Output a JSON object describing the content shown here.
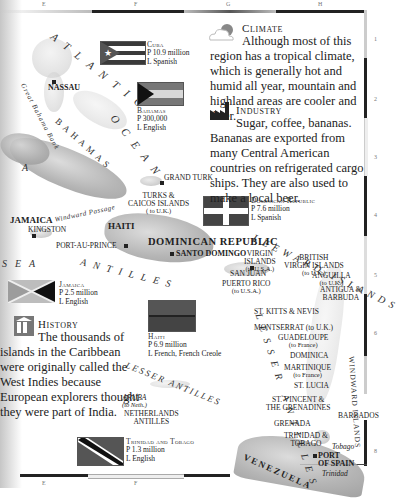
{
  "grid": {
    "columns": [
      "E",
      "F",
      "G",
      "H"
    ],
    "rows": [
      "1",
      "2",
      "3",
      "4",
      "5",
      "6",
      "7",
      "8"
    ]
  },
  "seas": {
    "atlantic": "ATLANTIC",
    "ocean": "OCEAN",
    "sea": "SEA",
    "antilles": "ANTILLES",
    "greater_letters": "A",
    "leeward": "LEEWARD ISLANDS",
    "windward": "WINDWARD ISLANDS",
    "lesser_antilles_east": "LESSER ANTILLES",
    "lesser_antilles_south": "LESSER ANTILLES",
    "bahamas_region": "BAHAMAS",
    "great_bahama_bank": "Great Bahama Bank",
    "windward_passage": "Windward Passage"
  },
  "places": {
    "nassau": "NASSAU",
    "grand_turk": "GRAND TURK",
    "turks_caicos": "TURKS &",
    "turks_caicos_2": "CAICOS ISLANDS",
    "turks_caicos_note": "( to U.K.)",
    "jamaica": "JAMAICA",
    "kingston": "KINGSTON",
    "haiti": "HAITI",
    "port_au_prince": "PORT-AU-PRINCE",
    "dominican_republic": "DOMINICAN REPUBLIC",
    "santo_domingo": "SANTO DOMINGO",
    "san_juan": "SAN JUAN",
    "puerto_rico": "PUERTO RICO",
    "puerto_rico_note": "(to U.S.A.)",
    "virgin_islands": "VIRGIN",
    "virgin_islands_2": "ISLANDS",
    "virgin_islands_note": "(to U.S.A.)",
    "british_virgin": "BRITISH",
    "british_virgin_2": "VIRGIN ISLANDS",
    "british_virgin_note": "(to U.K.)",
    "anguilla": "ANGUILLA",
    "anguilla_note": "(to U.K.)",
    "antigua": "ANTIGUA &",
    "antigua_2": "BARBUDA",
    "st_kitts": "ST. KITTS & NEVIS",
    "montserrat": "MONTSERRAT (to U.K.)",
    "guadeloupe": "GUADELOUPE",
    "guadeloupe_note": "(to France)",
    "dominica": "DOMINICA",
    "martinique": "MARTINIQUE",
    "martinique_note": "(to France)",
    "st_lucia": "ST. LUCIA",
    "st_vincent": "ST. VINCENT &",
    "st_vincent_2": "THE GRENADINES",
    "barbados": "BARBADOS",
    "grenada": "GRENADA",
    "trinidad_tobago": "TRINIDAD &",
    "trinidad_tobago_2": "TOBAGO",
    "tobago": "Tobago",
    "port_of_spain": "PORT",
    "port_of_spain_2": "OF SPAIN",
    "trinidad": "Trinidad",
    "venezuela": "VENEZUELA",
    "aruba": "ARUBA",
    "aruba_note": "(to Neth.)",
    "netherlands_antilles": "NETHERLANDS",
    "netherlands_antilles_2": "ANTILLES"
  },
  "flags": {
    "cuba": {
      "name": "Cuba",
      "population": "P 10.9 million",
      "language": "L Spanish"
    },
    "bahamas": {
      "name": "Bahamas",
      "population": "P 300,000",
      "language": "L English"
    },
    "dominican_republic": {
      "name": "Dominican Republic",
      "population": "P 7.6 million",
      "language": "L Spanish"
    },
    "jamaica": {
      "name": "Jamaica",
      "population": "P 2.5 million",
      "language": "L English"
    },
    "haiti": {
      "name": "Haiti",
      "population": "P 6.9 million",
      "language": "L French, French Creole"
    },
    "trinidad_tobago": {
      "name": "Trinidad and Tobago",
      "population": "P 1.3 million",
      "language": "L English"
    }
  },
  "topics": {
    "climate": {
      "icon": "cloud-sun-icon",
      "title": "Climate",
      "text": "Although most of this region has a tropical climate, which is generally hot and humid all year, mountain and highland areas are cooler and drier."
    },
    "industry": {
      "icon": "factory-icon",
      "title": "Industry",
      "text": "Sugar, coffee, bananas. Bananas are exported from many Central American countries on refrigerated cargo ships. They are also used to make a local beer."
    },
    "history": {
      "icon": "museum-icon",
      "title": "History",
      "text": "The thousands of islands in the Caribbean were originally called the West Indies because European explorers thought they were part of India."
    }
  }
}
